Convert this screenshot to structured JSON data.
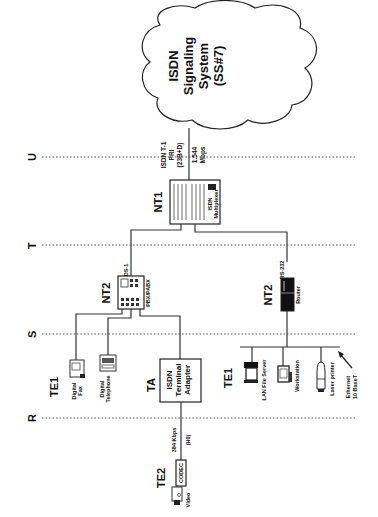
{
  "diagram": {
    "orientation": "rotated-90-ccw",
    "reference_points": [
      {
        "id": "R",
        "label": "R"
      },
      {
        "id": "S",
        "label": "S"
      },
      {
        "id": "T",
        "label": "T"
      },
      {
        "id": "U",
        "label": "U"
      }
    ],
    "cloud": {
      "line1": "ISDN",
      "line2": "Signaling",
      "line3": "System",
      "line4": "(SS#7)"
    },
    "pri_link": {
      "line1": "ISDN T-1",
      "line2": "PRI",
      "line3": "(23B+D)",
      "rate1": "1.544",
      "rate2": "Mbps"
    },
    "nt1": {
      "label": "NT1",
      "device_line1": "ISDN",
      "device_line2": "Multiplexer"
    },
    "nt2_pbx": {
      "label": "NT2",
      "link": "DS-1",
      "device": "PBX/PABX"
    },
    "nt2_router": {
      "label": "NT2",
      "link": "RS-232",
      "device": "Router"
    },
    "te1_phone_group": {
      "label": "TE1",
      "devices": [
        {
          "line1": "Digital",
          "line2": "Fax"
        },
        {
          "line1": "Digital",
          "line2": "Telephone"
        }
      ]
    },
    "ta": {
      "label": "TA",
      "line1": "ISDN",
      "line2": "Terminal",
      "line3": "Adapter"
    },
    "te1_lan_group": {
      "label": "TE1",
      "devices": [
        {
          "label": "LAN File Server"
        },
        {
          "label": "Workstation"
        },
        {
          "label": "Laser printer"
        }
      ],
      "ethernet_line1": "Ethernet",
      "ethernet_line2": "10 BaseT"
    },
    "te2": {
      "label": "TE2",
      "codec": "CODEC",
      "video": "Video",
      "rate": "384 Kbps",
      "channel": "(H0)"
    },
    "colors": {
      "ink": "#111111",
      "line": "#333333",
      "background": "#ffffff"
    }
  }
}
